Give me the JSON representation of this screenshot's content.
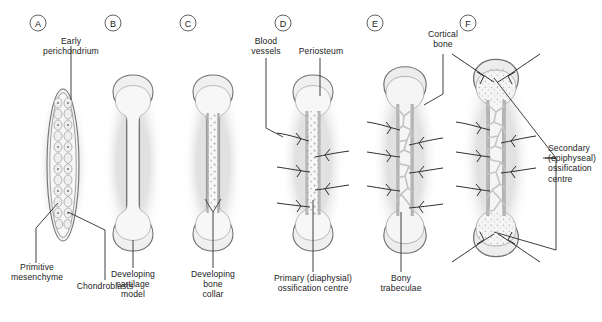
{
  "figure": {
    "background_color": "#ffffff",
    "ink_color": "#1c1c1c"
  },
  "panels": [
    {
      "letter": "A",
      "cx": 38,
      "name": "panel-a"
    },
    {
      "letter": "B",
      "cx": 113,
      "name": "panel-b"
    },
    {
      "letter": "C",
      "cx": 188,
      "name": "panel-c"
    },
    {
      "letter": "D",
      "cx": 283,
      "name": "panel-d"
    },
    {
      "letter": "E",
      "cx": 375,
      "name": "panel-e"
    },
    {
      "letter": "F",
      "cx": 468,
      "name": "panel-f"
    }
  ],
  "labels": {
    "early_perichondrium": "Early\nperichondrium",
    "primitive_mesenchyme": "Primitive\nmesenchyme",
    "chondroblasts": "Chondroblasts",
    "developing_cartilage_model": "Developing\ncartilage\nmodel",
    "developing_bone_collar": "Developing\nbone\ncollar",
    "blood_vessels": "Blood\nvessels",
    "periosteum": "Periosteum",
    "primary_ossification_centre": "Primary (diaphysial)\nossification centre",
    "cortical_bone": "Cortical\nbone",
    "bony_trabeculae": "Bony\ntrabeculae",
    "secondary_ossification_centre": "Secondary\n(epiphyseal)\nossification\ncentre"
  },
  "colors": {
    "outline": "#6e6e6e",
    "outline_dark": "#4a4a4a",
    "cartilage_fill": "#ededed",
    "cartilage_fill_light": "#f4f4f4",
    "bone_collar": "#bdbdbd",
    "trabecula": "#cfcfcf",
    "stipple": "#a8a8a8",
    "vessel": "#3a3a3a",
    "leader": "#2b2b2b",
    "halo": "#d9d9d9"
  }
}
